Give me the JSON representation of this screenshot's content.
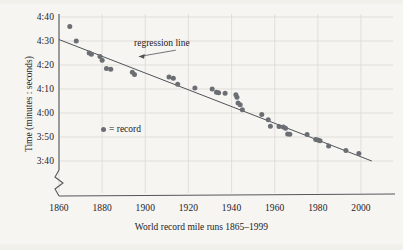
{
  "chart_data": {
    "type": "scatter",
    "title": "",
    "xlabel": "World record mile runs 1865–1999",
    "ylabel": "Time (minutes : seconds)",
    "xlim": [
      1860,
      2005
    ],
    "ylim": [
      215,
      280
    ],
    "xticks": [
      1860,
      1880,
      1900,
      1920,
      1940,
      1960,
      1980,
      2000
    ],
    "xtick_labels": [
      "1860",
      "1880",
      "1900",
      "1920",
      "1940",
      "1960",
      "1980",
      "2000"
    ],
    "yticks": [
      280,
      270,
      260,
      250,
      240,
      230,
      220
    ],
    "ytick_labels": [
      "4:40",
      "4:30",
      "4:20",
      "4:10",
      "4:00",
      "3:50",
      "3:40"
    ],
    "grid": true,
    "grid_color": "#d8d6d1",
    "y_axis_break": true,
    "point_color": "#6b6f73",
    "line_color": "#4f5357",
    "legend": {
      "position": "inside-left",
      "marker": "record-dot",
      "label": "= record"
    },
    "annotations": [
      {
        "text": "regression line",
        "x": 1916,
        "y": 267,
        "leader_to_x": 1897,
        "leader_to_y": 263.5
      }
    ],
    "series": [
      {
        "name": "record",
        "points": [
          [
            1865,
            276.0
          ],
          [
            1868,
            270.0
          ],
          [
            1874,
            265.0
          ],
          [
            1875,
            264.5
          ],
          [
            1879,
            263.5
          ],
          [
            1880,
            262.0
          ],
          [
            1882,
            258.5
          ],
          [
            1884,
            258.2
          ],
          [
            1894,
            257.0
          ],
          [
            1895,
            256.0
          ],
          [
            1911,
            255.0
          ],
          [
            1913,
            254.5
          ],
          [
            1915,
            252.0
          ],
          [
            1923,
            250.4
          ],
          [
            1931,
            250.0
          ],
          [
            1933,
            248.6
          ],
          [
            1934,
            248.4
          ],
          [
            1937,
            248.2
          ],
          [
            1942,
            247.6
          ],
          [
            1942.5,
            246.6
          ],
          [
            1943,
            244.2
          ],
          [
            1944,
            243.4
          ],
          [
            1945,
            241.4
          ],
          [
            1954,
            239.4
          ],
          [
            1957,
            237.2
          ],
          [
            1958,
            234.5
          ],
          [
            1962,
            234.4
          ],
          [
            1964,
            234.2
          ],
          [
            1965,
            233.6
          ],
          [
            1966,
            231.3
          ],
          [
            1967,
            231.1
          ],
          [
            1975,
            231.0
          ],
          [
            1979,
            229.0
          ],
          [
            1980,
            228.8
          ],
          [
            1981,
            228.4
          ],
          [
            1985,
            226.3
          ],
          [
            1993,
            224.4
          ],
          [
            1999,
            223.1
          ]
        ]
      }
    ],
    "regression_line": {
      "name": "regression line",
      "x_start": 1860,
      "y_start": 270.6,
      "x_end": 2005,
      "y_end": 220.0
    }
  },
  "axes": {
    "y_labels": [
      "4:40",
      "4:30",
      "4:20",
      "4:10",
      "4:00",
      "3:50",
      "3:40"
    ],
    "x_labels": [
      "1860",
      "1880",
      "1900",
      "1920",
      "1940",
      "1960",
      "1980",
      "2000"
    ],
    "y_title": "Time (minutes : seconds)",
    "x_title": "World record mile runs 1865–1999"
  },
  "annotation": {
    "regression_label": "regression line"
  },
  "legend": {
    "label": "= record"
  }
}
